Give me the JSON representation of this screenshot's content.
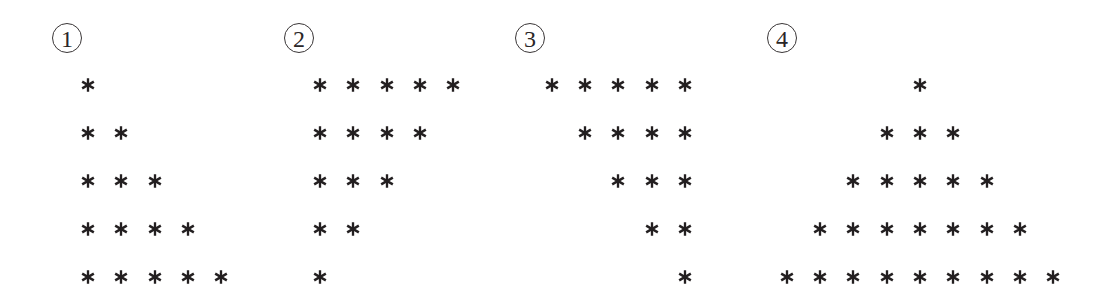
{
  "figure": {
    "glyph": "*",
    "ink_color": "#231f20",
    "column_spacing_px": 33.3,
    "row_spacing_px": 48,
    "row_y": [
      85,
      133,
      181,
      229,
      277
    ],
    "patterns": [
      {
        "label": "1",
        "label_center": [
          67,
          38
        ],
        "shape": "left-aligned increasing triangle",
        "row_counts": [
          1,
          2,
          3,
          4,
          5
        ],
        "rows": [
          "*",
          "* *",
          "* * *",
          "* * * *",
          "* * * * *"
        ],
        "first_col_x": 88,
        "align": "left"
      },
      {
        "label": "2",
        "label_center": [
          299,
          38
        ],
        "shape": "left-aligned decreasing triangle",
        "row_counts": [
          5,
          4,
          3,
          2,
          1
        ],
        "rows": [
          "* * * * *",
          "* * * *",
          "* * *",
          "* *",
          "*"
        ],
        "first_col_x": 320,
        "align": "left"
      },
      {
        "label": "3",
        "label_center": [
          530,
          38
        ],
        "shape": "right-aligned decreasing triangle",
        "row_counts": [
          5,
          4,
          3,
          2,
          1
        ],
        "rows": [
          "* * * * *",
          "* * * *",
          "* * *",
          "* *",
          "*"
        ],
        "last_col_x": 685,
        "align": "right"
      },
      {
        "label": "4",
        "label_center": [
          782,
          38
        ],
        "shape": "centered pyramid",
        "row_counts": [
          1,
          3,
          5,
          7,
          9
        ],
        "rows": [
          "*",
          "* * *",
          "* * * * *",
          "* * * * * * *",
          "* * * * * * * * *"
        ],
        "center_x": 920,
        "align": "center"
      }
    ]
  }
}
